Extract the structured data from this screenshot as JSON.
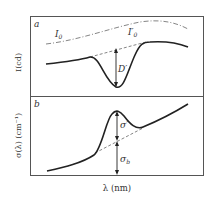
{
  "figure": {
    "panel_a": {
      "label": "a",
      "ylabel": "I(cd)",
      "curve_labels": {
        "I0": "I",
        "I0_sub": "0",
        "I0prime": "I′",
        "I0prime_sub": "0",
        "D": "D′"
      }
    },
    "panel_b": {
      "label": "b",
      "ylabel": "σ(λ) (cm⁻¹)",
      "curve_labels": {
        "sigma_prime": "σ′",
        "sigma_b": "σ",
        "sigma_b_sub": "b"
      }
    },
    "xlabel": "λ (nm)"
  },
  "colors": {
    "frame": "#555555",
    "curve": "#222222",
    "dashed": "#777777"
  }
}
